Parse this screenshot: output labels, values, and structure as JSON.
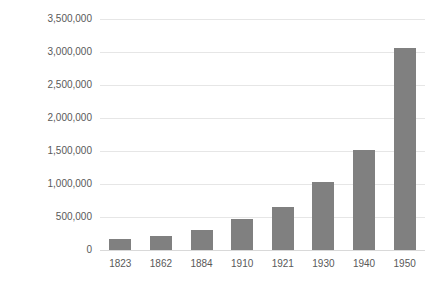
{
  "chart_data": {
    "type": "bar",
    "title": "",
    "subtitle": "",
    "xlabel": "",
    "ylabel": "",
    "categories": [
      "1823",
      "1862",
      "1884",
      "1910",
      "1921",
      "1930",
      "1940",
      "1950"
    ],
    "values": [
      170000,
      210000,
      300000,
      470000,
      650000,
      1030000,
      1520000,
      3060000
    ],
    "series": [
      {
        "name": "Population",
        "values": [
          170000,
          210000,
          300000,
          470000,
          650000,
          1030000,
          1520000,
          3060000
        ]
      }
    ],
    "ylim": [
      0,
      3500000
    ],
    "ytick_values": [
      0,
      500000,
      1000000,
      1500000,
      2000000,
      2500000,
      3000000,
      3500000
    ],
    "ytick_labels": [
      "0",
      "500,000",
      "1,000,000",
      "1,500,000",
      "2,000,000",
      "2,500,000",
      "3,000,000",
      "3,500,000"
    ],
    "grid": true,
    "grid_axis": "y",
    "legend": false,
    "legend_position": "none",
    "annotations": [],
    "colors": {
      "bar": "#808080",
      "gridline": "#e6e6e6",
      "baseline": "#d9d9d9",
      "text": "#595959",
      "background": "#ffffff"
    }
  }
}
